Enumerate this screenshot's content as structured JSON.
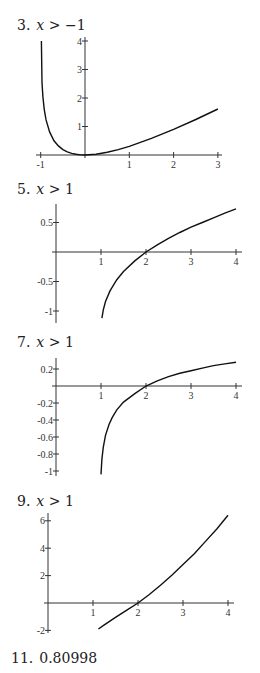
{
  "chart_data": [
    {
      "type": "line",
      "label_number": "3.",
      "condition": "x > −1",
      "title": "3. x > −1",
      "xlabel": "",
      "ylabel": "",
      "xlim": [
        -1,
        3
      ],
      "ylim": [
        0,
        4
      ],
      "x_ticks": [
        "-1",
        "1",
        "2",
        "3"
      ],
      "y_ticks": [
        "1",
        "2",
        "3",
        "4"
      ],
      "grid": false,
      "series": [
        {
          "name": "f(x)",
          "x": [
            -0.985,
            -0.97,
            -0.95,
            -0.92,
            -0.88,
            -0.8,
            -0.7,
            -0.6,
            -0.5,
            -0.4,
            -0.3,
            -0.2,
            -0.1,
            0,
            0.25,
            0.5,
            0.75,
            1,
            1.5,
            2,
            2.5,
            3
          ],
          "y": [
            4.0,
            2.54,
            2.05,
            1.61,
            1.24,
            0.81,
            0.5,
            0.32,
            0.19,
            0.11,
            0.057,
            0.023,
            0.005,
            0,
            0.027,
            0.095,
            0.19,
            0.307,
            0.584,
            0.901,
            1.247,
            1.614
          ]
        }
      ],
      "frame": {
        "x0px": 85,
        "y0px": 155,
        "xscale": 44.3,
        "yscale": 28.5,
        "xmin_px": 36,
        "xmax_px": 222,
        "ymin_px": 158,
        "ymax_px": 37
      }
    },
    {
      "type": "line",
      "label_number": "5.",
      "condition": "x > 1",
      "title": "5. x > 1",
      "xlabel": "",
      "ylabel": "",
      "xlim": [
        0,
        4
      ],
      "ylim": [
        -1.2,
        0.8
      ],
      "x_ticks": [
        "1",
        "2",
        "3",
        "4"
      ],
      "y_ticks": [
        "0.5",
        "-0.5",
        "-1"
      ],
      "grid": false,
      "series": [
        {
          "name": "f(x)",
          "x": [
            1.02,
            1.05,
            1.1,
            1.2,
            1.35,
            1.5,
            1.75,
            2,
            2.25,
            2.5,
            2.75,
            3,
            3.25,
            3.5,
            3.75,
            4
          ],
          "y": [
            -1.12,
            -0.98,
            -0.84,
            -0.66,
            -0.47,
            -0.33,
            -0.15,
            0,
            0.12,
            0.23,
            0.33,
            0.42,
            0.5,
            0.58,
            0.66,
            0.73
          ]
        }
      ],
      "frame": {
        "x0px": 56,
        "y0px": 252,
        "xscale": 45,
        "yscale": 59,
        "xmin_px": 52,
        "xmax_px": 242,
        "ymin_px": 323,
        "ymax_px": 204
      }
    },
    {
      "type": "line",
      "label_number": "7.",
      "condition": "x > 1",
      "title": "7. x > 1",
      "xlabel": "",
      "ylabel": "",
      "xlim": [
        0,
        4
      ],
      "ylim": [
        -1.05,
        0.3
      ],
      "x_ticks": [
        "1",
        "2",
        "3",
        "4"
      ],
      "y_ticks": [
        "0.2",
        "-0.2",
        "-0.4",
        "-0.6",
        "-0.8",
        "-1"
      ],
      "grid": false,
      "series": [
        {
          "name": "f(x)",
          "x": [
            1.0,
            1.02,
            1.05,
            1.1,
            1.18,
            1.25,
            1.35,
            1.5,
            1.75,
            2,
            2.25,
            2.5,
            2.75,
            3,
            3.25,
            3.5,
            3.75,
            4
          ],
          "y": [
            -1.04,
            -0.86,
            -0.72,
            -0.58,
            -0.45,
            -0.37,
            -0.28,
            -0.19,
            -0.09,
            0,
            0.06,
            0.11,
            0.15,
            0.18,
            0.21,
            0.24,
            0.26,
            0.28
          ]
        }
      ],
      "frame": {
        "x0px": 56,
        "y0px": 386,
        "xscale": 45,
        "yscale": 85,
        "xmin_px": 52,
        "xmax_px": 242,
        "ymin_px": 476,
        "ymax_px": 358
      }
    },
    {
      "type": "line",
      "label_number": "9.",
      "condition": "x > 1",
      "title": "9. x > 1",
      "xlabel": "",
      "ylabel": "",
      "xlim": [
        0,
        4
      ],
      "ylim": [
        -2,
        6.5
      ],
      "x_ticks": [
        "1",
        "2",
        "3",
        "4"
      ],
      "y_ticks": [
        "6",
        "4",
        "2",
        "-2"
      ],
      "grid": false,
      "series": [
        {
          "name": "f(x)",
          "x": [
            1.12,
            1.25,
            1.5,
            1.75,
            2,
            2.25,
            2.5,
            2.75,
            3,
            3.25,
            3.5,
            3.75,
            4
          ],
          "y": [
            -1.9,
            -1.6,
            -1.05,
            -0.52,
            0,
            0.62,
            1.3,
            2.02,
            2.8,
            3.6,
            4.5,
            5.4,
            6.4
          ]
        }
      ],
      "frame": {
        "x0px": 48,
        "y0px": 603,
        "xscale": 45,
        "yscale": 13.7,
        "xmin_px": 44,
        "xmax_px": 234,
        "ymin_px": 633,
        "ymax_px": 513
      }
    }
  ],
  "answers": [
    {
      "number": "3.",
      "condition_var": "x",
      "condition_rest": " > −1"
    },
    {
      "number": "5.",
      "condition_var": "x",
      "condition_rest": " > 1"
    },
    {
      "number": "7.",
      "condition_var": "x",
      "condition_rest": " > 1"
    },
    {
      "number": "9.",
      "condition_var": "x",
      "condition_rest": " > 1"
    },
    {
      "number": "11.",
      "value": "0.80998"
    }
  ]
}
